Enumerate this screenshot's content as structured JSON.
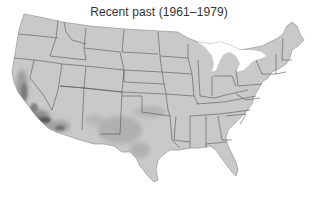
{
  "map": {
    "title": "Recent past (1961–1979)",
    "region": "Contiguous United States",
    "style": "grayscale shaded map with state borders",
    "colors": {
      "land": "#c9c9c9",
      "border": "#555555",
      "shade_light": "#b3b3b3",
      "shade_medium": "#9a9a9a",
      "shade_dark": "#5a5a5a",
      "background": "#ffffff"
    },
    "highlighted_areas": [
      {
        "name": "Southern California",
        "intensity": "dark"
      },
      {
        "name": "Central Valley California",
        "intensity": "medium"
      },
      {
        "name": "Arizona",
        "intensity": "medium"
      },
      {
        "name": "Texas",
        "intensity": "light"
      },
      {
        "name": "Oklahoma",
        "intensity": "light"
      },
      {
        "name": "New Mexico",
        "intensity": "light"
      }
    ]
  }
}
